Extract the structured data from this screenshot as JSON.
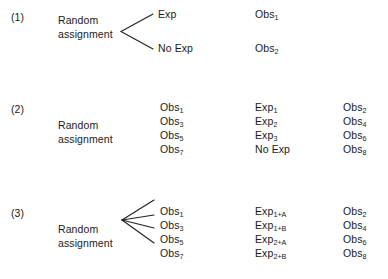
{
  "figure": {
    "background_color": "#ffffff",
    "text_color": "#1a1a1a",
    "line_color": "#222222"
  },
  "designs": [
    {
      "index_label": "(1)",
      "source_line_1": "Random",
      "source_line_2": "assignment",
      "branch_count": 2,
      "columns": {
        "treatment": [
          "Exp",
          "No Exp"
        ],
        "followup": [],
        "posttest": [
          "Obs",
          "Obs"
        ]
      },
      "cells": {
        "a0_text": "Exp",
        "a0_sub": "",
        "a1_text": "No Exp",
        "a1_sub": "",
        "c0_text": "Obs",
        "c0_sub": "1",
        "c1_text": "Obs",
        "c1_sub": "2"
      }
    },
    {
      "index_label": "(2)",
      "source_line_1": "Random",
      "source_line_2": "assignment",
      "branch_count": 4,
      "cells": {
        "a0_text": "Obs",
        "a0_sub": "1",
        "a1_text": "Obs",
        "a1_sub": "3",
        "a2_text": "Obs",
        "a2_sub": "5",
        "a3_text": "Obs",
        "a3_sub": "7",
        "b0_text": "Exp",
        "b0_sub": "1",
        "b1_text": "Exp",
        "b1_sub": "2",
        "b2_text": "Exp",
        "b2_sub": "3",
        "b3_text": "No Exp",
        "b3_sub": "",
        "c0_text": "Obs",
        "c0_sub": "2",
        "c1_text": "Obs",
        "c1_sub": "4",
        "c2_text": "Obs",
        "c2_sub": "6",
        "c3_text": "Obs",
        "c3_sub": "8"
      }
    },
    {
      "index_label": "(3)",
      "source_line_1": "Random",
      "source_line_2": "assignment",
      "branch_count": 4,
      "cells": {
        "a0_text": "Obs",
        "a0_sub": "1",
        "a1_text": "Obs",
        "a1_sub": "3",
        "a2_text": "Obs",
        "a2_sub": "5",
        "a3_text": "Obs",
        "a3_sub": "7",
        "b0_text": "Exp",
        "b0_sub": "1+A",
        "b1_text": "Exp",
        "b1_sub": "1+B",
        "b2_text": "Exp",
        "b2_sub": "2+A",
        "b3_text": "Exp",
        "b3_sub": "2+B",
        "c0_text": "Obs",
        "c0_sub": "2",
        "c1_text": "Obs",
        "c1_sub": "4",
        "c2_text": "Obs",
        "c2_sub": "6",
        "c3_text": "Obs",
        "c3_sub": "8"
      }
    }
  ]
}
